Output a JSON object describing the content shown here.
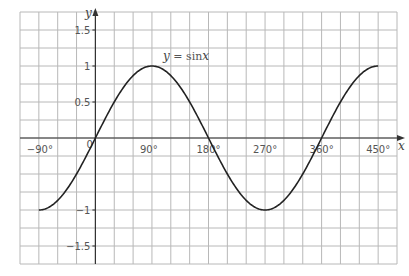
{
  "chart_data": {
    "type": "line",
    "title": "",
    "curve_label": "y = sinx",
    "curve_label_parts": {
      "y": "y",
      "eq": " = sin",
      "x": "x"
    },
    "xlabel": "x",
    "ylabel": "y",
    "xlim": [
      -120,
      480
    ],
    "ylim": [
      -1.75,
      1.75
    ],
    "grid": true,
    "x_grid_step": 30,
    "y_grid_step": 0.25,
    "x_ticks": [
      {
        "value": -90,
        "label": "−90°"
      },
      {
        "value": 0,
        "label": "0"
      },
      {
        "value": 90,
        "label": "90°"
      },
      {
        "value": 180,
        "label": "180°"
      },
      {
        "value": 270,
        "label": "270°"
      },
      {
        "value": 360,
        "label": "360°"
      },
      {
        "value": 450,
        "label": "450°"
      }
    ],
    "y_ticks": [
      {
        "value": 1.5,
        "label": "1.5"
      },
      {
        "value": 1,
        "label": "1"
      },
      {
        "value": 0.5,
        "label": "0.5"
      },
      {
        "value": -1,
        "label": "−1"
      },
      {
        "value": -1.5,
        "label": "−1.5"
      }
    ],
    "series": [
      {
        "name": "y = sinx",
        "function": "sin",
        "x_range": [
          -90,
          450
        ],
        "x": [
          -90,
          -60,
          -30,
          0,
          30,
          60,
          90,
          120,
          150,
          180,
          210,
          240,
          270,
          300,
          330,
          360,
          390,
          420,
          450
        ],
        "values": [
          -1,
          -0.87,
          -0.5,
          0,
          0.5,
          0.87,
          1,
          0.87,
          0.5,
          0,
          -0.5,
          -0.87,
          -1,
          -0.87,
          -0.5,
          0,
          0.5,
          0.87,
          1
        ]
      }
    ],
    "colors": {
      "grid": "#b8b8b8",
      "axis": "#333333",
      "curve": "#222222",
      "text": "#555555"
    }
  }
}
